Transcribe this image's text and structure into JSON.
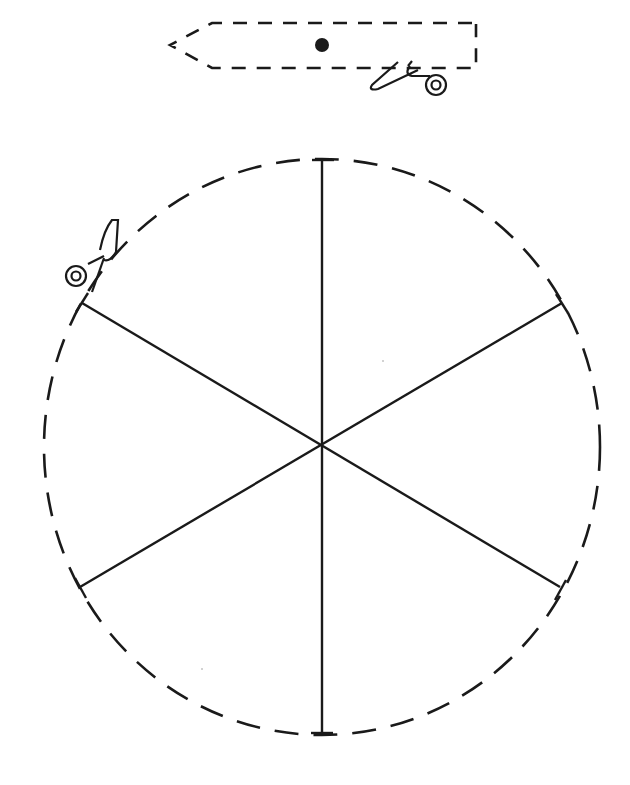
{
  "template": {
    "title": "Paper spinner cut-out template",
    "ink_color": "#1a1a1a",
    "background_color": "#ffffff"
  },
  "pointer_strip": {
    "description": "Dashed arrow-shaped strip with a hole marker",
    "shape": "arrow",
    "outline": "dashed",
    "hole_marker": "filled-dot"
  },
  "wheel": {
    "description": "Dashed circle divided into six equal segments",
    "outline": "dashed",
    "segments": 6,
    "divider_lines": 3
  },
  "icons": [
    {
      "name": "scissors-icon",
      "location": "below right end of pointer strip"
    },
    {
      "name": "scissors-icon",
      "location": "upper-left edge of wheel"
    }
  ]
}
